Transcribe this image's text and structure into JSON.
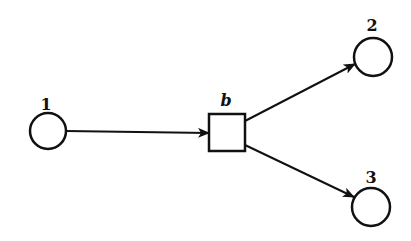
{
  "diagram": {
    "type": "directed-graph",
    "colors": {
      "stroke": "#111111",
      "fill": "#ffffff",
      "background": "#ffffff"
    },
    "places": [
      {
        "id": "1",
        "label": "1",
        "cx": 48,
        "cy": 131,
        "r": 18,
        "label_x": 46,
        "label_y": 110
      },
      {
        "id": "2",
        "label": "2",
        "cx": 373,
        "cy": 57,
        "r": 19,
        "label_x": 372,
        "label_y": 31
      },
      {
        "id": "3",
        "label": "3",
        "cx": 371,
        "cy": 207,
        "r": 19,
        "label_x": 371,
        "label_y": 183
      }
    ],
    "transitions": [
      {
        "id": "b",
        "label": "b",
        "x": 209,
        "y": 114,
        "w": 36,
        "h": 37,
        "label_x": 226,
        "label_y": 106
      }
    ],
    "edges": [
      {
        "from": "1",
        "to": "b",
        "x1": 66,
        "y1": 131,
        "x2": 209,
        "y2": 133
      },
      {
        "from": "b",
        "to": "2",
        "x1": 245,
        "y1": 121,
        "x2": 355,
        "y2": 64
      },
      {
        "from": "b",
        "to": "3",
        "x1": 245,
        "y1": 145,
        "x2": 354,
        "y2": 197
      }
    ]
  }
}
